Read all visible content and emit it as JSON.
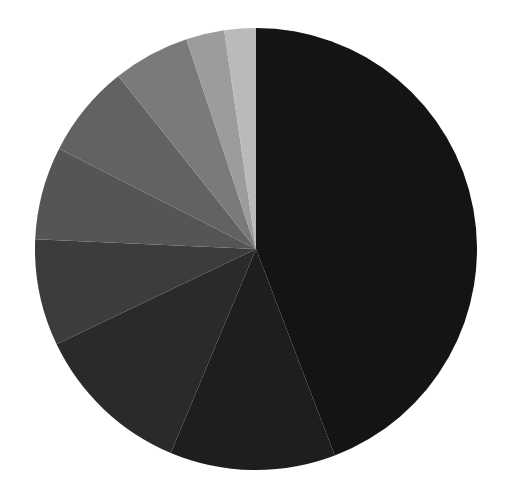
{
  "chart_data": {
    "type": "pie",
    "title": "",
    "start_angle_deg": 0,
    "direction": "clockwise",
    "labels": [
      "Slice 1",
      "Slice 2",
      "Slice 3",
      "Slice 4",
      "Slice 5",
      "Slice 6",
      "Slice 7",
      "Slice 8",
      "Slice 9"
    ],
    "values": [
      44.2,
      12.1,
      11.6,
      7.8,
      6.8,
      6.8,
      5.6,
      2.8,
      2.3
    ],
    "colors": [
      "#141414",
      "#1e1e1e",
      "#2a2a2a",
      "#3c3c3c",
      "#555555",
      "#626262",
      "#7a7a7a",
      "#9c9c9c",
      "#bababa"
    ],
    "legend": null,
    "data_labels_visible": false
  },
  "layout": {
    "center_x": 256,
    "center_y": 249,
    "radius": 221
  }
}
